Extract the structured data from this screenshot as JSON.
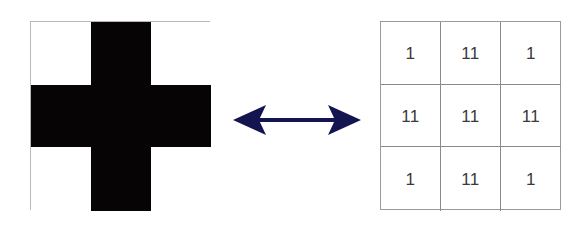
{
  "diagram": {
    "left_grid": {
      "description": "3x3 binary image of a plus/cross shape",
      "rows": [
        [
          "empty",
          "filled",
          "empty"
        ],
        [
          "filled",
          "filled",
          "filled"
        ],
        [
          "empty",
          "filled",
          "empty"
        ]
      ],
      "colors": {
        "filled": "#060404",
        "empty": "#ffffff"
      }
    },
    "arrow": {
      "type": "bidirectional",
      "color": "#141450"
    },
    "right_grid": {
      "description": "3x3 numeric matrix encoding",
      "rows": [
        [
          "1",
          "11",
          "1"
        ],
        [
          "11",
          "11",
          "11"
        ],
        [
          "1",
          "11",
          "1"
        ]
      ]
    }
  }
}
